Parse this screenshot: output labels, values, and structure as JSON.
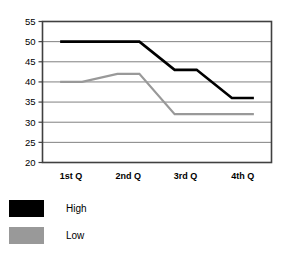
{
  "chart_data": {
    "type": "line",
    "title": "",
    "subtitle": "",
    "xlabel": "",
    "ylabel": "",
    "categories": [
      "1st Q",
      "2nd Q",
      "3rd Q",
      "4th Q"
    ],
    "series": [
      {
        "name": "High",
        "color": "#000000",
        "values": [
          50,
          50,
          43,
          36
        ]
      },
      {
        "name": "Low",
        "color": "#999999",
        "values": [
          40,
          42,
          32,
          32
        ]
      }
    ],
    "ylim": [
      20,
      55
    ],
    "yticks": [
      20,
      25,
      30,
      35,
      40,
      45,
      50,
      55
    ],
    "ytick_labels": [
      "20",
      "25",
      "30",
      "35",
      "40",
      "45",
      "50",
      "55"
    ],
    "grid": true,
    "grid_axis": "y",
    "grid_color": "#808080",
    "plot_border_color": "#404040",
    "legend_position": "bottom-left",
    "legend": [
      {
        "label": "High",
        "color": "#000000"
      },
      {
        "label": "Low",
        "color": "#999999"
      }
    ]
  }
}
